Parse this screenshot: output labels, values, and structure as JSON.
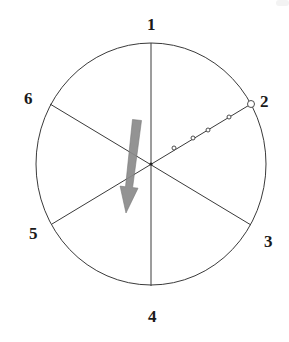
{
  "diagram": {
    "type": "hexpartite circle diagram",
    "colors": {
      "line": "#3a3a3a",
      "arrow": "#8a8a8a",
      "arrow_edge": "#6e6e6e",
      "label": "#1a1a1a",
      "background": "#ffffff"
    },
    "circle": {
      "cx": 151,
      "cy": 164,
      "rx": 115,
      "ry": 121
    },
    "points": [
      {
        "id": "1",
        "label": "1",
        "label_x": 147,
        "label_y": 30
      },
      {
        "id": "2",
        "label": "2",
        "label_x": 260,
        "label_y": 107
      },
      {
        "id": "3",
        "label": "3",
        "label_x": 264,
        "label_y": 247
      },
      {
        "id": "4",
        "label": "4",
        "label_x": 148,
        "label_y": 322
      },
      {
        "id": "5",
        "label": "5",
        "label_x": 29,
        "label_y": 239
      },
      {
        "id": "6",
        "label": "6",
        "label_x": 24,
        "label_y": 104
      }
    ],
    "diameters": [
      {
        "from": "1",
        "to": "4",
        "x1": 151,
        "y1": 43,
        "x2": 151,
        "y2": 286
      },
      {
        "from": "6",
        "to": "3",
        "x1": 50,
        "y1": 104,
        "x2": 251,
        "y2": 225
      },
      {
        "from": "5",
        "to": "2",
        "x1": 52,
        "y1": 224,
        "x2": 251,
        "y2": 104
      }
    ],
    "path_markers": {
      "description": "small open circles along radius toward point 2",
      "dots": [
        {
          "x": 174,
          "y": 148,
          "r": 2
        },
        {
          "x": 193,
          "y": 138,
          "r": 2
        },
        {
          "x": 208,
          "y": 130,
          "r": 2
        },
        {
          "x": 229,
          "y": 117,
          "r": 2
        },
        {
          "x": 251,
          "y": 104,
          "r": 3.5
        }
      ]
    },
    "arrow": {
      "description": "gray downward arrow",
      "x1": 137,
      "y1": 120,
      "x2": 126,
      "y2": 213
    }
  }
}
